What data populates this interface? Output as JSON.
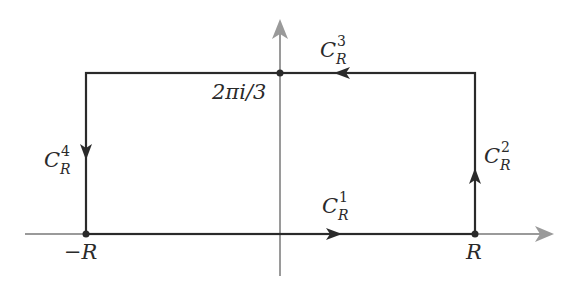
{
  "diagram": {
    "type": "contour",
    "colors": {
      "contour": "#2a2a2a",
      "axes": "#999999",
      "background": "#ffffff"
    },
    "axes": {
      "real_axis": true,
      "imaginary_axis": true
    },
    "points": {
      "neg_r": {
        "label": "−R"
      },
      "pos_r": {
        "label": "R"
      },
      "top": {
        "label": "2πi/3"
      }
    },
    "segments": [
      {
        "id": "c1",
        "base": "C",
        "sup": "1",
        "sub": "R",
        "direction": "right"
      },
      {
        "id": "c2",
        "base": "C",
        "sup": "2",
        "sub": "R",
        "direction": "up"
      },
      {
        "id": "c3",
        "base": "C",
        "sup": "3",
        "sub": "R",
        "direction": "left"
      },
      {
        "id": "c4",
        "base": "C",
        "sup": "4",
        "sub": "R",
        "direction": "down"
      }
    ]
  }
}
